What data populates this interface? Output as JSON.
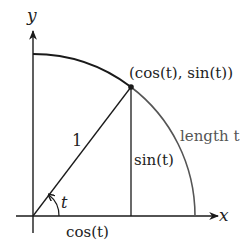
{
  "diagram": {
    "axes": {
      "x_label": "x",
      "y_label": "y"
    },
    "labels": {
      "radius": "1",
      "angle": "t",
      "horizontal_leg": "cos(t)",
      "vertical_leg": "sin(t)",
      "point": "(cos(t), sin(t))",
      "arc_length": "length t"
    },
    "colors": {
      "axes": "#1a1a1a",
      "upper_arc": "#1a1a1a",
      "lower_arc": "#555555",
      "arc_label": "#555555",
      "point": "#1a1a1a"
    },
    "geometry": {
      "origin_px": [
        33,
        216
      ],
      "radius_px": 162,
      "point_px": [
        131,
        87
      ]
    }
  }
}
